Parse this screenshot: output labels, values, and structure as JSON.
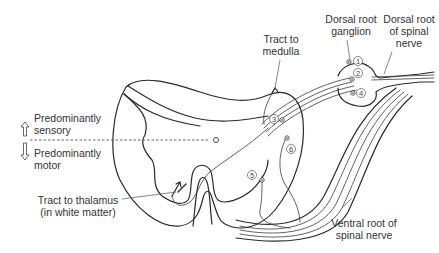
{
  "figure": {
    "type": "anatomical-diagram",
    "colors": {
      "line": "#2a2a2a",
      "label_text": "#333333",
      "background": "#ffffff"
    }
  },
  "labels": {
    "dorsal_root_ganglion": [
      "Dorsal root",
      "ganglion"
    ],
    "dorsal_root_of_spinal_nerve": [
      "Dorsal root",
      "of spinal",
      "nerve"
    ],
    "tract_to_medulla": [
      "Tract to",
      "medulla"
    ],
    "predominantly_sensory": [
      "Predominantly",
      "sensory"
    ],
    "predominantly_motor": [
      "Predominantly",
      "motor"
    ],
    "tract_to_thalamus": [
      "Tract to thalamus",
      "(in white matter)"
    ],
    "ventral_root_of_spinal_nerve": [
      "Ventral root of",
      "spinal nerve"
    ]
  },
  "neuron_markers": [
    {
      "id": "1",
      "label": "1",
      "location": "dorsal root ganglion (top)"
    },
    {
      "id": "2",
      "label": "2",
      "location": "dorsal root ganglion (middle)"
    },
    {
      "id": "3",
      "label": "3",
      "location": "dorsal horn entry"
    },
    {
      "id": "4",
      "label": "4",
      "location": "dorsal root ganglion (bottom)"
    },
    {
      "id": "5",
      "label": "5",
      "location": "ventral horn (medial)"
    },
    {
      "id": "6",
      "label": "6",
      "location": "lateral horn"
    }
  ],
  "arrows": {
    "sensory_direction": "up-arrow-icon",
    "motor_direction": "down-arrow-icon"
  }
}
